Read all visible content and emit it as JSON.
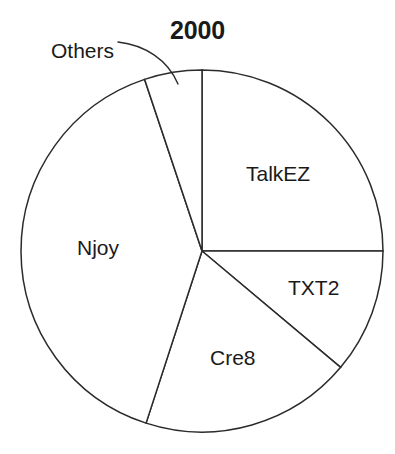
{
  "chart_data": {
    "type": "pie",
    "title": "2000",
    "xlabel": "",
    "ylabel": "",
    "legend_position": "none",
    "grid": false,
    "labels_placement": "inside-slices-with-leader-for-others",
    "start_angle_deg": 0,
    "direction": "clockwise",
    "categories": [
      "TalkEZ",
      "TXT2",
      "Cre8",
      "Njoy",
      "Others"
    ],
    "values": [
      25,
      11,
      19,
      40,
      5
    ],
    "angles_deg": [
      90,
      40,
      68,
      143.5,
      18.5
    ],
    "slices": [
      {
        "label": "TalkEZ",
        "value": 25,
        "angle_deg": 90,
        "start_deg": 0,
        "end_deg": 90,
        "label_x": 246,
        "label_y": 163,
        "label_inside": true
      },
      {
        "label": "TXT2",
        "value": 11,
        "angle_deg": 40,
        "start_deg": 90,
        "end_deg": 130,
        "label_x": 288,
        "label_y": 277,
        "label_inside": true
      },
      {
        "label": "Cre8",
        "value": 19,
        "angle_deg": 68,
        "start_deg": 130,
        "end_deg": 198,
        "label_x": 210,
        "label_y": 347,
        "label_inside": true
      },
      {
        "label": "Njoy",
        "value": 40,
        "angle_deg": 143.5,
        "start_deg": 198,
        "end_deg": 341.5,
        "label_x": 77,
        "label_y": 237,
        "label_inside": true
      },
      {
        "label": "Others",
        "value": 5,
        "angle_deg": 18.5,
        "start_deg": 341.5,
        "end_deg": 360,
        "label_x": 51,
        "label_y": 40,
        "label_inside": false
      }
    ],
    "geometry": {
      "center_x": 202,
      "center_y": 251,
      "radius": 181
    },
    "style": {
      "slice_fill": "#ffffff",
      "slice_stroke": "#2b2b2b",
      "text_color": "#1a1a1a",
      "background": "#ffffff"
    }
  }
}
